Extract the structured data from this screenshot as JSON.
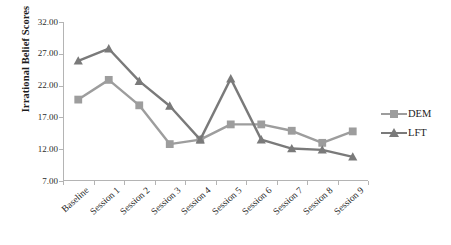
{
  "chart_data": {
    "type": "line",
    "title": "",
    "xlabel": "",
    "ylabel": "Irrational Belief Scores",
    "categories": [
      "Baseline",
      "Session 1",
      "Session 2",
      "Session 3",
      "Session 4",
      "Session 5",
      "Session 6",
      "Session 7",
      "Session 8",
      "Session 9"
    ],
    "ytick_labels": [
      "32.00",
      "27.00",
      "22.00",
      "17.00",
      "12.00",
      "7.00"
    ],
    "ytick_values": [
      32.0,
      27.0,
      22.0,
      17.0,
      12.0,
      7.0
    ],
    "ylim": [
      7.0,
      32.0
    ],
    "grid": false,
    "legend_position": "right",
    "series": [
      {
        "name": "DEM",
        "marker": "square",
        "color": "#9d9d9d",
        "values": [
          19.8,
          22.9,
          18.9,
          12.8,
          13.5,
          15.9,
          15.9,
          14.9,
          13.0,
          14.8
        ]
      },
      {
        "name": "LFT",
        "marker": "triangle",
        "color": "#7a7a7a",
        "values": [
          25.9,
          27.8,
          22.7,
          18.8,
          13.5,
          23.1,
          13.5,
          12.1,
          11.9,
          10.8
        ]
      }
    ]
  },
  "legend": {
    "items": [
      {
        "label": "DEM"
      },
      {
        "label": "LFT"
      }
    ]
  },
  "axis": {
    "y_title": "Irrational Belief Scores"
  },
  "colors": {
    "dem": "#9d9d9d",
    "lft": "#7a7a7a",
    "axis": "#b4b4b4",
    "text": "#1c1c1c",
    "background": "#ffffff"
  }
}
